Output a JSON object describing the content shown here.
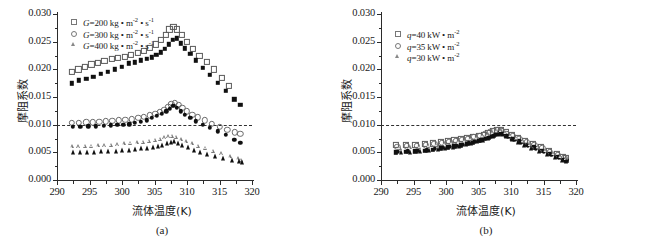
{
  "figure": {
    "panels": [
      {
        "id": "a",
        "caption": "(a)",
        "axis": {
          "xlabel": "流体温度(K)",
          "ylabel": "摩阻系数",
          "xlim": [
            290,
            320
          ],
          "ylim": [
            0.0,
            0.03
          ],
          "xticks": [
            290,
            295,
            300,
            305,
            310,
            315,
            320
          ],
          "xtick_labels": [
            "290",
            "295",
            "300",
            "305",
            "310",
            "315",
            "320"
          ],
          "yticks": [
            0.0,
            0.005,
            0.01,
            0.015,
            0.02,
            0.025,
            0.03
          ],
          "ytick_labels": [
            "0.000",
            "0.005",
            "0.010",
            "0.015",
            "0.020",
            "0.025",
            "0.030"
          ]
        },
        "reference_line": {
          "value": 0.01,
          "style": "dashed"
        },
        "legend": [
          {
            "marker": "square-open",
            "label_prefix": "G",
            "label_rest": "=200 kg • m",
            "sup1": "-2",
            "mid": " • s",
            "sup2": "-1"
          },
          {
            "marker": "circle-open",
            "label_prefix": "G",
            "label_rest": "=300 kg • m",
            "sup1": "-2",
            "mid": " • s",
            "sup2": "-1"
          },
          {
            "marker": "triangle-open",
            "label_prefix": "G",
            "label_rest": "=400 kg • m",
            "sup1": "-2",
            "mid": " • s",
            "sup2": "-1"
          }
        ]
      },
      {
        "id": "b",
        "caption": "(b)",
        "axis": {
          "xlabel": "流体温度(K)",
          "ylabel": "摩阻系数",
          "xlim": [
            290,
            320
          ],
          "ylim": [
            0.0,
            0.03
          ],
          "xticks": [
            290,
            295,
            300,
            305,
            310,
            315,
            320
          ],
          "xtick_labels": [
            "290",
            "295",
            "300",
            "305",
            "310",
            "315",
            "320"
          ],
          "yticks": [
            0.0,
            0.005,
            0.01,
            0.015,
            0.02,
            0.025,
            0.03
          ],
          "ytick_labels": [
            "0.000",
            "0.005",
            "0.010",
            "0.015",
            "0.020",
            "0.025",
            "0.030"
          ]
        },
        "reference_line": {
          "value": 0.01,
          "style": "dashed"
        },
        "legend": [
          {
            "marker": "square-open",
            "label_prefix": "q",
            "label_rest": "=40 kW • m",
            "sup1": "-2",
            "mid": "",
            "sup2": ""
          },
          {
            "marker": "circle-open",
            "label_prefix": "q",
            "label_rest": "=35 kW • m",
            "sup1": "-2",
            "mid": "",
            "sup2": ""
          },
          {
            "marker": "triangle-open",
            "label_prefix": "q",
            "label_rest": "=30 kW • m",
            "sup1": "-2",
            "mid": "",
            "sup2": ""
          }
        ]
      }
    ]
  },
  "chart_data": [
    {
      "type": "scatter",
      "panel": "a",
      "title": "",
      "xlabel": "流体温度(K)",
      "ylabel": "摩阻系数",
      "xlim": [
        290,
        320
      ],
      "ylim": [
        0.0,
        0.03
      ],
      "grid": false,
      "legend_position": "top-left",
      "reference_line_y": 0.01,
      "series": [
        {
          "name": "G=200 kg • m-2 • s-1 (open square)",
          "marker": "square-open",
          "x": [
            292.3,
            293.3,
            294.3,
            295.3,
            296.3,
            297.3,
            298.4,
            299.4,
            300.4,
            301.4,
            302.4,
            303.4,
            304.3,
            305.2,
            306.0,
            306.7,
            307.3,
            307.9,
            308.5,
            309.2,
            310.0,
            310.9,
            311.9,
            313.0,
            314.2,
            315.4,
            316.5
          ],
          "y": [
            0.0195,
            0.02,
            0.0205,
            0.0209,
            0.0212,
            0.0215,
            0.0219,
            0.022,
            0.0222,
            0.0226,
            0.023,
            0.0234,
            0.0239,
            0.0245,
            0.0253,
            0.0262,
            0.0272,
            0.0277,
            0.0272,
            0.0262,
            0.025,
            0.0237,
            0.0225,
            0.0213,
            0.02,
            0.0184,
            0.017
          ]
        },
        {
          "name": "G=200 kg • m-2 • s-1 (filled square)",
          "marker": "square-filled",
          "x": [
            292.3,
            293.4,
            294.5,
            295.6,
            296.7,
            297.8,
            298.9,
            300.0,
            301.0,
            302.0,
            302.9,
            303.8,
            304.6,
            305.3,
            306.0,
            306.6,
            307.2,
            307.8,
            308.4,
            309.0,
            309.7,
            310.5,
            311.4,
            312.4,
            313.5,
            314.7,
            316.0,
            317.3,
            318.2
          ],
          "y": [
            0.0175,
            0.018,
            0.0183,
            0.0187,
            0.0192,
            0.0196,
            0.02,
            0.0205,
            0.0211,
            0.0213,
            0.0216,
            0.0219,
            0.0222,
            0.0226,
            0.0231,
            0.0237,
            0.0245,
            0.0253,
            0.0256,
            0.0247,
            0.0238,
            0.0228,
            0.0216,
            0.0203,
            0.019,
            0.0176,
            0.0161,
            0.0146,
            0.0136
          ]
        },
        {
          "name": "G=300 kg • m-2 • s-1 (open circle)",
          "marker": "circle-open",
          "x": [
            292.3,
            293.4,
            294.5,
            295.5,
            296.5,
            297.5,
            298.5,
            299.5,
            300.5,
            301.5,
            302.5,
            303.4,
            304.3,
            305.1,
            305.8,
            306.5,
            307.1,
            307.6,
            308.1,
            308.7,
            309.3,
            310.0,
            310.8,
            311.7,
            312.7,
            313.8,
            315.0,
            316.2,
            317.4,
            318.2
          ],
          "y": [
            0.0103,
            0.0103,
            0.0104,
            0.0104,
            0.0105,
            0.0106,
            0.0107,
            0.0108,
            0.0109,
            0.011,
            0.0112,
            0.0114,
            0.0117,
            0.012,
            0.0123,
            0.0127,
            0.0132,
            0.0137,
            0.014,
            0.0136,
            0.013,
            0.0124,
            0.0118,
            0.0113,
            0.0108,
            0.0102,
            0.0096,
            0.0091,
            0.0086,
            0.0083
          ]
        },
        {
          "name": "G=300 kg • m-2 • s-1 (filled circle)",
          "marker": "circle-filled",
          "x": [
            292.4,
            293.6,
            294.8,
            296.0,
            297.2,
            298.3,
            299.3,
            300.2,
            301.1,
            302.0,
            302.9,
            303.8,
            304.6,
            305.4,
            306.1,
            306.8,
            307.4,
            307.9,
            308.4,
            309.0,
            309.7,
            310.5,
            311.4,
            312.4,
            313.5,
            314.7,
            316.0,
            317.3,
            318.2
          ],
          "y": [
            0.0096,
            0.0096,
            0.0097,
            0.0097,
            0.0098,
            0.0099,
            0.01,
            0.01,
            0.0101,
            0.0103,
            0.0105,
            0.0108,
            0.0112,
            0.0116,
            0.012,
            0.0124,
            0.0129,
            0.0134,
            0.013,
            0.0124,
            0.0118,
            0.0112,
            0.0106,
            0.01,
            0.0094,
            0.0088,
            0.0082,
            0.0073,
            0.0067
          ]
        },
        {
          "name": "G=400 kg • m-2 • s-1 (open triangle)",
          "marker": "triangle-open",
          "x": [
            292.3,
            293.3,
            294.3,
            295.3,
            296.3,
            297.3,
            298.3,
            299.3,
            300.3,
            301.3,
            302.3,
            303.2,
            304.1,
            305.0,
            305.8,
            306.5,
            307.1,
            307.7,
            308.3,
            309.0,
            309.8,
            310.7,
            311.7,
            312.8,
            314.0,
            315.3,
            316.6,
            317.8,
            318.3
          ],
          "y": [
            0.0061,
            0.0061,
            0.0062,
            0.0062,
            0.0063,
            0.0063,
            0.0064,
            0.0065,
            0.0066,
            0.0067,
            0.0068,
            0.0069,
            0.0071,
            0.0073,
            0.0075,
            0.0077,
            0.0079,
            0.008,
            0.0078,
            0.0074,
            0.007,
            0.0066,
            0.0062,
            0.0058,
            0.0053,
            0.0048,
            0.0043,
            0.0039,
            0.0037
          ]
        },
        {
          "name": "G=400 kg • m-2 • s-1 (filled triangle)",
          "marker": "triangle-filled",
          "x": [
            292.4,
            293.5,
            294.6,
            295.7,
            296.8,
            297.9,
            299.0,
            300.0,
            301.0,
            302.0,
            302.9,
            303.8,
            304.7,
            305.5,
            306.2,
            306.9,
            307.5,
            308.0,
            308.6,
            309.3,
            310.1,
            311.0,
            312.0,
            313.1,
            314.3,
            315.6,
            316.9,
            318.0,
            318.4
          ],
          "y": [
            0.005,
            0.005,
            0.0051,
            0.0051,
            0.0052,
            0.0053,
            0.0053,
            0.0054,
            0.0055,
            0.0056,
            0.0057,
            0.0058,
            0.006,
            0.0062,
            0.0064,
            0.0066,
            0.0068,
            0.007,
            0.0067,
            0.0063,
            0.0059,
            0.0055,
            0.0051,
            0.0047,
            0.0043,
            0.0039,
            0.0036,
            0.0034,
            0.0033
          ]
        }
      ]
    },
    {
      "type": "scatter",
      "panel": "b",
      "title": "",
      "xlabel": "流体温度(K)",
      "ylabel": "摩阻系数",
      "xlim": [
        290,
        320
      ],
      "ylim": [
        0.0,
        0.03
      ],
      "grid": false,
      "legend_position": "top-left",
      "reference_line_y": 0.01,
      "series": [
        {
          "name": "q=40 kW • m-2 (open square)",
          "marker": "square-open",
          "x": [
            292.3,
            293.8,
            295.3,
            296.7,
            298.0,
            299.2,
            300.3,
            301.3,
            302.3,
            303.2,
            304.1,
            305.0,
            305.8,
            306.5,
            307.2,
            307.8,
            308.4,
            309.2,
            310.1,
            311.1,
            312.2,
            313.4,
            314.6,
            315.8,
            317.0,
            318.0,
            318.4
          ],
          "y": [
            0.0063,
            0.0063,
            0.0064,
            0.0065,
            0.0066,
            0.0068,
            0.007,
            0.0072,
            0.0074,
            0.0076,
            0.0078,
            0.008,
            0.0082,
            0.0085,
            0.0088,
            0.009,
            0.009,
            0.0086,
            0.0081,
            0.0076,
            0.0071,
            0.0065,
            0.0059,
            0.0053,
            0.0047,
            0.0042,
            0.004
          ]
        },
        {
          "name": "q=40 kW • m-2 (filled square)",
          "marker": "square-filled",
          "x": [
            292.3,
            293.8,
            295.3,
            296.7,
            298.0,
            299.2,
            300.3,
            301.3,
            302.3,
            303.2,
            304.1,
            305.0,
            305.8,
            306.6,
            307.3,
            307.9,
            308.5,
            309.3,
            310.2,
            311.2,
            312.3,
            313.5,
            314.7,
            315.9,
            317.1,
            318.1,
            318.5
          ],
          "y": [
            0.005,
            0.0051,
            0.0052,
            0.0053,
            0.0055,
            0.0057,
            0.0059,
            0.0061,
            0.0063,
            0.0065,
            0.0068,
            0.0071,
            0.0074,
            0.0077,
            0.0081,
            0.0084,
            0.0084,
            0.008,
            0.0075,
            0.007,
            0.0064,
            0.0059,
            0.0053,
            0.0047,
            0.0042,
            0.0037,
            0.0035
          ]
        },
        {
          "name": "q=35 kW • m-2 (open circle)",
          "marker": "circle-open",
          "x": [
            292.5,
            294.0,
            295.5,
            296.9,
            298.2,
            299.4,
            300.5,
            301.5,
            302.5,
            303.4,
            304.3,
            305.2,
            306.0,
            306.7,
            307.4,
            308.0,
            308.6,
            309.4,
            310.3,
            311.3,
            312.4,
            313.6,
            314.8,
            316.0,
            317.2,
            318.2
          ],
          "y": [
            0.006,
            0.0061,
            0.0062,
            0.0063,
            0.0065,
            0.0067,
            0.0069,
            0.0071,
            0.0073,
            0.0075,
            0.0078,
            0.008,
            0.0083,
            0.0086,
            0.0089,
            0.0091,
            0.0089,
            0.0084,
            0.0079,
            0.0074,
            0.0069,
            0.0063,
            0.0057,
            0.0051,
            0.0045,
            0.004
          ]
        },
        {
          "name": "q=35 kW • m-2 (filled circle)",
          "marker": "circle-filled",
          "x": [
            292.6,
            294.1,
            295.6,
            297.0,
            298.3,
            299.5,
            300.6,
            301.6,
            302.6,
            303.5,
            304.4,
            305.3,
            306.1,
            306.9,
            307.6,
            308.2,
            308.8,
            309.6,
            310.5,
            311.5,
            312.6,
            313.8,
            315.0,
            316.2,
            317.4,
            318.3
          ],
          "y": [
            0.0051,
            0.0052,
            0.0053,
            0.0054,
            0.0056,
            0.0058,
            0.006,
            0.0062,
            0.0064,
            0.0066,
            0.0069,
            0.0072,
            0.0075,
            0.0078,
            0.0082,
            0.0085,
            0.0083,
            0.0078,
            0.0073,
            0.0068,
            0.0062,
            0.0057,
            0.0051,
            0.0046,
            0.0041,
            0.0036
          ]
        },
        {
          "name": "q=30 kW • m-2 (open triangle)",
          "marker": "triangle-open",
          "x": [
            292.9,
            294.4,
            295.9,
            297.3,
            298.6,
            299.8,
            300.9,
            301.9,
            302.9,
            303.8,
            304.7,
            305.6,
            306.4,
            307.1,
            307.8,
            308.4,
            309.1,
            309.9,
            310.8,
            311.8,
            312.9,
            314.1,
            315.3,
            316.5,
            317.6,
            318.4
          ],
          "y": [
            0.0058,
            0.0059,
            0.006,
            0.0062,
            0.0064,
            0.0066,
            0.0068,
            0.007,
            0.0072,
            0.0075,
            0.0077,
            0.008,
            0.0083,
            0.0086,
            0.0089,
            0.009,
            0.0086,
            0.0081,
            0.0076,
            0.0071,
            0.0065,
            0.006,
            0.0054,
            0.0048,
            0.0043,
            0.0039
          ]
        },
        {
          "name": "q=30 kW • m-2 (filled triangle)",
          "marker": "triangle-filled",
          "x": [
            293.0,
            294.5,
            296.0,
            297.4,
            298.7,
            299.9,
            301.0,
            302.0,
            303.0,
            303.9,
            304.8,
            305.7,
            306.5,
            307.3,
            308.0,
            308.6,
            309.3,
            310.1,
            311.0,
            312.0,
            313.1,
            314.3,
            315.5,
            316.7,
            317.8,
            318.5
          ],
          "y": [
            0.005,
            0.0051,
            0.0053,
            0.0054,
            0.0056,
            0.0058,
            0.006,
            0.0062,
            0.0065,
            0.0067,
            0.007,
            0.0073,
            0.0076,
            0.008,
            0.0083,
            0.0083,
            0.0079,
            0.0074,
            0.0069,
            0.0063,
            0.0058,
            0.0052,
            0.0047,
            0.0042,
            0.0037,
            0.0034
          ]
        }
      ]
    }
  ]
}
